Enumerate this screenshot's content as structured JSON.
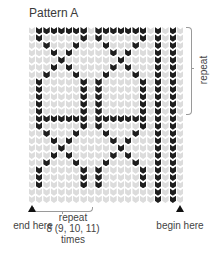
{
  "title": "Pattern A",
  "labels": {
    "repeat_vertical": "repeat",
    "end_here": "end here",
    "begin_here": "begin here",
    "repeat_horizontal_line1": "repeat",
    "repeat_horizontal_line2": "8 (9, 10, 11)",
    "repeat_horizontal_line3": "times"
  },
  "chart_data": {
    "type": "heatmap",
    "title": "Pattern A",
    "columns": 21,
    "rows": 24,
    "colors": {
      "light": "#dcdcdc",
      "dark": "#1e1e1e"
    },
    "legend": [],
    "row_repeat": {
      "rows": 12,
      "label": "repeat"
    },
    "column_repeat": {
      "columns": 8,
      "label": "repeat 8 (9, 10, 11) times"
    },
    "annotations": [
      "end here",
      "begin here"
    ],
    "motif_rows": [
      "0111111101111111010100",
      "0100000101000001010100",
      "0010001000100010010100",
      "0001010000010100010100",
      "0000100000001000010100",
      "0001010000010100010100",
      "0010001000100010010100",
      "0100000101000001010100",
      "0100000101000001010100",
      "0100000101000001010100",
      "0100000101000001010100",
      "0100000101000001010100"
    ]
  }
}
